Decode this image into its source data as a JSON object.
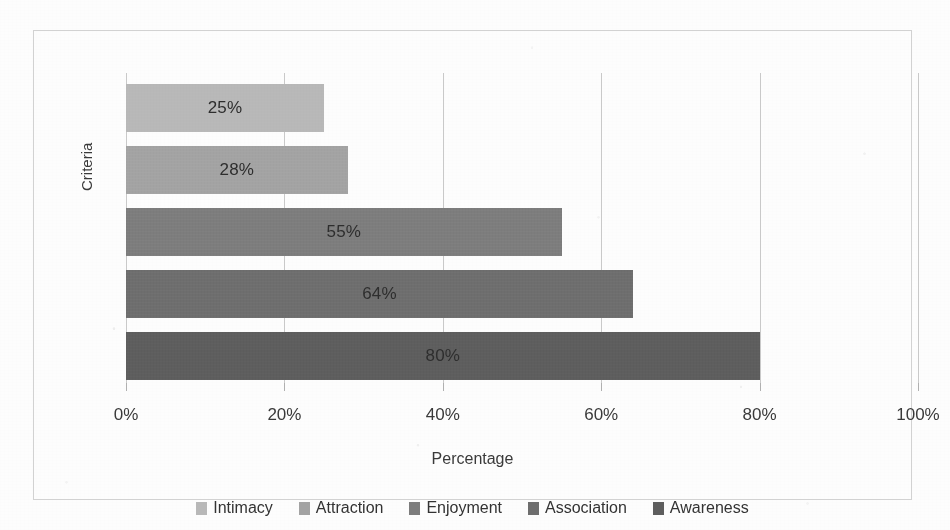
{
  "chart_data": {
    "type": "bar",
    "orientation": "horizontal",
    "title": "",
    "xlabel": "Percentage",
    "ylabel": "Criteria",
    "xlim": [
      0,
      100
    ],
    "xticks": [
      "0%",
      "20%",
      "40%",
      "60%",
      "80%",
      "100%"
    ],
    "xtick_values": [
      0,
      20,
      40,
      60,
      80,
      100
    ],
    "grid": true,
    "legend_position": "bottom",
    "categories": [
      "Intimacy",
      "Attraction",
      "Enjoyment",
      "Association",
      "Awareness"
    ],
    "values": [
      25,
      28,
      55,
      64,
      80
    ],
    "data_labels": [
      "25%",
      "28%",
      "55%",
      "64%",
      "80%"
    ],
    "colors": [
      "#b8b8b8",
      "#a3a3a3",
      "#7d7d7d",
      "#6e6e6e",
      "#5e5e5e"
    ],
    "bars": [
      {
        "label": "Intimacy",
        "value": 25,
        "data_label": "25%",
        "color": "#b8b8b8"
      },
      {
        "label": "Attraction",
        "value": 28,
        "data_label": "28%",
        "color": "#a3a3a3"
      },
      {
        "label": "Enjoyment",
        "value": 55,
        "data_label": "55%",
        "color": "#7d7d7d"
      },
      {
        "label": "Association",
        "value": 64,
        "data_label": "64%",
        "color": "#6e6e6e"
      },
      {
        "label": "Awareness",
        "value": 80,
        "data_label": "80%",
        "color": "#5e5e5e"
      }
    ]
  },
  "axes": {
    "x_title": "Percentage",
    "y_title": "Criteria",
    "x_tick_labels": [
      "0%",
      "20%",
      "40%",
      "60%",
      "80%",
      "100%"
    ]
  },
  "legend": {
    "items": [
      {
        "label": "Intimacy",
        "color": "#b8b8b8"
      },
      {
        "label": "Attraction",
        "color": "#a3a3a3"
      },
      {
        "label": "Enjoyment",
        "color": "#7d7d7d"
      },
      {
        "label": "Association",
        "color": "#6e6e6e"
      },
      {
        "label": "Awareness",
        "color": "#5e5e5e"
      }
    ]
  }
}
